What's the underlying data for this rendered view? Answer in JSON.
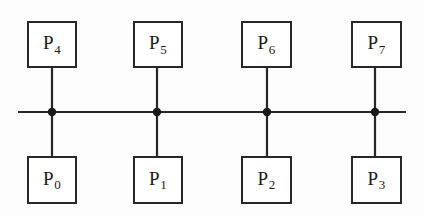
{
  "diagram": {
    "type": "network-bus-diagram",
    "colors": {
      "background": "#fdfdfd",
      "stroke": "#272727",
      "node_fill": "#ffffff",
      "label": "#1a1a1a",
      "junction": "#1a1a1a"
    },
    "bus": {
      "orientation": "horizontal",
      "x_start": 18,
      "x_end": 406,
      "y": 112,
      "stroke_width": 2.2
    },
    "junctions": [
      {
        "name": "junction-0",
        "x": 52,
        "y": 112,
        "radius": 4.2
      },
      {
        "name": "junction-1",
        "x": 157,
        "y": 112,
        "radius": 4.2
      },
      {
        "name": "junction-2",
        "x": 267,
        "y": 112,
        "radius": 4.2
      },
      {
        "name": "junction-3",
        "x": 375,
        "y": 112,
        "radius": 4.2
      }
    ],
    "columns": [
      {
        "index": 0,
        "stem_x": 52,
        "box_left": 27,
        "box_width": 50
      },
      {
        "index": 1,
        "stem_x": 157,
        "box_left": 133,
        "box_width": 50
      },
      {
        "index": 2,
        "stem_x": 267,
        "box_left": 241,
        "box_width": 51
      },
      {
        "index": 3,
        "stem_x": 375,
        "box_left": 351,
        "box_width": 51
      }
    ],
    "rows": {
      "top": {
        "box_top": 21,
        "box_height": 47,
        "stem_from": 68,
        "stem_to": 112
      },
      "bottom": {
        "box_top": 156,
        "box_height": 48,
        "stem_from": 112,
        "stem_to": 156
      }
    },
    "nodes": [
      {
        "name": "node-p4",
        "letter": "P",
        "subscript": "4",
        "column": 0,
        "row": "top"
      },
      {
        "name": "node-p5",
        "letter": "P",
        "subscript": "5",
        "column": 1,
        "row": "top"
      },
      {
        "name": "node-p6",
        "letter": "P",
        "subscript": "6",
        "column": 2,
        "row": "top"
      },
      {
        "name": "node-p7",
        "letter": "P",
        "subscript": "7",
        "column": 3,
        "row": "top"
      },
      {
        "name": "node-p0",
        "letter": "P",
        "subscript": "0",
        "column": 0,
        "row": "bottom"
      },
      {
        "name": "node-p1",
        "letter": "P",
        "subscript": "1",
        "column": 1,
        "row": "bottom"
      },
      {
        "name": "node-p2",
        "letter": "P",
        "subscript": "2",
        "column": 2,
        "row": "bottom"
      },
      {
        "name": "node-p3",
        "letter": "P",
        "subscript": "3",
        "column": 3,
        "row": "bottom"
      }
    ],
    "labels": {
      "top_row": [
        "P4",
        "P5",
        "P6",
        "P7"
      ],
      "bottom_row": [
        "P0",
        "P1",
        "P2",
        "P3"
      ]
    }
  }
}
